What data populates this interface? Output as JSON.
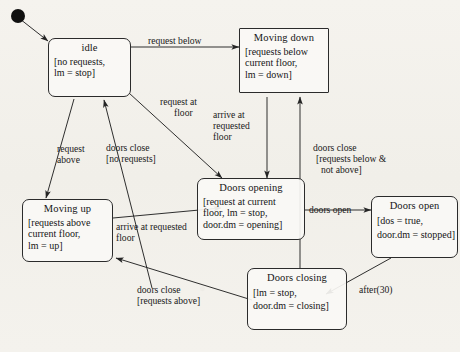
{
  "diagram": {
    "kind": "uml-state-machine",
    "initial_marker": "filled-circle",
    "stroke_color": "#2b2b2b",
    "background_color": "#f3f1ec",
    "states": [
      {
        "id": "idle",
        "title": "idle",
        "body": [
          "[no requests,",
          " lm = stop]"
        ],
        "shape": "rounded-rect"
      },
      {
        "id": "moving_down",
        "title": "Moving down",
        "body": [
          "[requests below",
          "current floor,",
          "lm = down]"
        ],
        "shape": "rect"
      },
      {
        "id": "moving_up",
        "title": "Moving up",
        "body": [
          "[requests above",
          "current floor,",
          " lm = up]"
        ],
        "shape": "rounded-rect"
      },
      {
        "id": "doors_opening",
        "title": "Doors opening",
        "body": [
          "[request at current",
          "floor, lm = stop,",
          "door.dm = opening]"
        ],
        "shape": "rounded-rect"
      },
      {
        "id": "doors_open",
        "title": "Doors open",
        "body": [
          "[dos = true,",
          "door.dm = stopped]"
        ],
        "shape": "rounded-rect"
      },
      {
        "id": "doors_closing",
        "title": "Doors closing",
        "body": [
          "[lm = stop,",
          "door.dm = closing]"
        ],
        "shape": "rounded-rect"
      }
    ],
    "transitions": [
      {
        "id": "t1",
        "from": "initial",
        "to": "idle",
        "label": []
      },
      {
        "id": "t2",
        "from": "idle",
        "to": "moving_down",
        "label": [
          "request below"
        ]
      },
      {
        "id": "t3",
        "from": "idle",
        "to": "doors_opening",
        "label": [
          "request at",
          "floor"
        ]
      },
      {
        "id": "t4",
        "from": "moving_down",
        "to": "doors_opening",
        "label": [
          "arrive at",
          "requested",
          "floor"
        ]
      },
      {
        "id": "t5",
        "from": "idle",
        "to": "moving_up",
        "label": [
          "request",
          "above"
        ]
      },
      {
        "id": "t6",
        "from": "doors_closing",
        "to": "idle",
        "label": [
          "doors close",
          "[no requests]"
        ]
      },
      {
        "id": "t7",
        "from": "doors_closing",
        "to": "moving_down",
        "label": [
          "doors close",
          "[requests below &",
          "not above]"
        ]
      },
      {
        "id": "t8",
        "from": "doors_opening",
        "to": "doors_open",
        "label": [
          "doors open"
        ]
      },
      {
        "id": "t9",
        "from": "doors_open",
        "to": "doors_closing",
        "label": [
          "after(30)"
        ]
      },
      {
        "id": "t10",
        "from": "moving_up",
        "to": "doors_opening",
        "label": [
          "arrive at requested",
          "floor"
        ]
      },
      {
        "id": "t11",
        "from": "doors_closing",
        "to": "moving_up",
        "label": [
          "doors close",
          "[requests above]"
        ]
      }
    ]
  }
}
